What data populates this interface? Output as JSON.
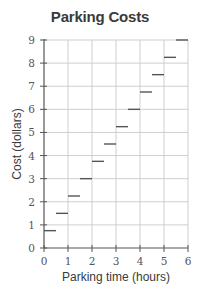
{
  "chart_data": {
    "type": "line",
    "subtype": "step",
    "title": "Parking Costs",
    "xlabel": "Parking time (hours)",
    "ylabel": "Cost (dollars)",
    "xlim": [
      0,
      6
    ],
    "ylim": [
      0,
      9
    ],
    "x_ticks": [
      "0",
      "1",
      "2",
      "3",
      "4",
      "5",
      "6"
    ],
    "y_ticks": [
      "0",
      "1",
      "2",
      "3",
      "4",
      "5",
      "6",
      "7",
      "8",
      "9"
    ],
    "grid": true,
    "legend": null,
    "series": [
      {
        "name": "Parking cost",
        "segments": [
          {
            "x_start": 0.0,
            "x_end": 0.5,
            "y": 0.75
          },
          {
            "x_start": 0.5,
            "x_end": 1.0,
            "y": 1.5
          },
          {
            "x_start": 1.0,
            "x_end": 1.5,
            "y": 2.25
          },
          {
            "x_start": 1.5,
            "x_end": 2.0,
            "y": 3.0
          },
          {
            "x_start": 2.0,
            "x_end": 2.5,
            "y": 3.75
          },
          {
            "x_start": 2.5,
            "x_end": 3.0,
            "y": 4.5
          },
          {
            "x_start": 3.0,
            "x_end": 3.5,
            "y": 5.25
          },
          {
            "x_start": 3.5,
            "x_end": 4.0,
            "y": 6.0
          },
          {
            "x_start": 4.0,
            "x_end": 4.5,
            "y": 6.75
          },
          {
            "x_start": 4.5,
            "x_end": 5.0,
            "y": 7.5
          },
          {
            "x_start": 5.0,
            "x_end": 5.5,
            "y": 8.25
          },
          {
            "x_start": 5.5,
            "x_end": 6.0,
            "y": 9.0
          }
        ]
      }
    ],
    "colors": {
      "segment": "#555555",
      "grid": "#cfcfcf",
      "axis": "#555555"
    }
  }
}
